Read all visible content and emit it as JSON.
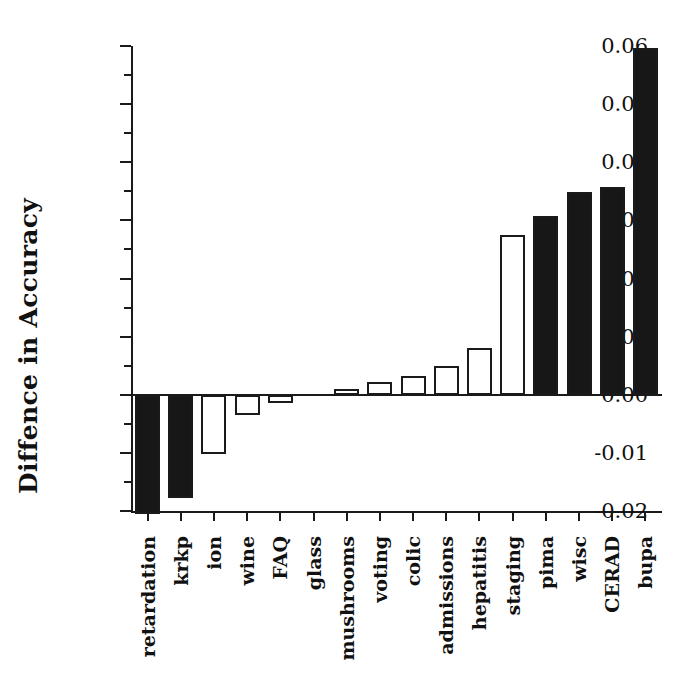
{
  "chart_data": {
    "type": "bar",
    "title": "",
    "xlabel": "",
    "ylabel": "Diffence in Accuracy",
    "ylim": [
      -0.02,
      0.06
    ],
    "ytick_labels": [
      "0.06",
      "0.05",
      "0.04",
      "0.03",
      "0.02",
      "0.01",
      "0.00",
      "-0.01",
      "-0.02"
    ],
    "ytick_values": [
      0.06,
      0.05,
      0.04,
      0.03,
      0.02,
      0.01,
      0.0,
      -0.01,
      -0.02
    ],
    "minor_tick_interval": 0.005,
    "grid": false,
    "legend": null,
    "legend_position": "none",
    "bar_styles": [
      "filled",
      "hollow"
    ],
    "categories": [
      "retardation",
      "krkp",
      "ion",
      "wine",
      "FAQ",
      "glass",
      "mushrooms",
      "voting",
      "colic",
      "admissions",
      "hepatitis",
      "staging",
      "pima",
      "wisc",
      "CERAD",
      "bupa"
    ],
    "values": [
      -0.0205,
      -0.0178,
      -0.0102,
      -0.0035,
      -0.0015,
      0.0,
      0.001,
      0.0022,
      0.0033,
      0.005,
      0.008,
      0.0275,
      0.0307,
      0.0348,
      0.0357,
      0.0597
    ],
    "fills": [
      "filled",
      "filled",
      "hollow",
      "hollow",
      "hollow",
      "hollow",
      "hollow",
      "hollow",
      "hollow",
      "hollow",
      "hollow",
      "hollow",
      "filled",
      "filled",
      "filled",
      "filled"
    ]
  }
}
